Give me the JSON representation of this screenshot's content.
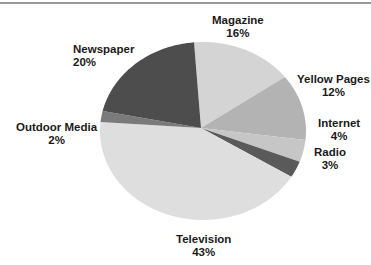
{
  "chart_data": {
    "type": "pie",
    "title": "",
    "start_angle_deg": -5,
    "direction": "clockwise",
    "slices": [
      {
        "label": "Magazine",
        "value": 16,
        "pct_label": "16%",
        "color": "#d4d4d4"
      },
      {
        "label": "Yellow Pages",
        "value": 12,
        "pct_label": "12%",
        "color": "#b3b3b3"
      },
      {
        "label": "Internet",
        "value": 4,
        "pct_label": "4%",
        "color": "#c6c6c6"
      },
      {
        "label": "Radio",
        "value": 3,
        "pct_label": "3%",
        "color": "#5a5a5a"
      },
      {
        "label": "Television",
        "value": 43,
        "pct_label": "43%",
        "color": "#dedede"
      },
      {
        "label": "Outdoor Media",
        "value": 2,
        "pct_label": "2%",
        "color": "#7a7a7a"
      },
      {
        "label": "Newspaper",
        "value": 20,
        "pct_label": "20%",
        "color": "#4d4d4d"
      }
    ],
    "legend": "none (direct labels)"
  },
  "labels": {
    "magazine": {
      "name": "Magazine",
      "pct": "16%"
    },
    "yellow_pages": {
      "name": "Yellow Pages",
      "pct": "12%"
    },
    "internet": {
      "name": "Internet",
      "pct": "4%"
    },
    "radio": {
      "name": "Radio",
      "pct": "3%"
    },
    "television": {
      "name": "Television",
      "pct": "43%"
    },
    "outdoor_media": {
      "name": "Outdoor Media",
      "pct": "2%"
    },
    "newspaper": {
      "name": "Newspaper",
      "pct": "20%"
    }
  }
}
